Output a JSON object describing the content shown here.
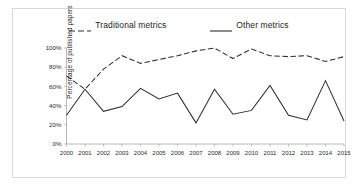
{
  "figure": {
    "background_color": "#ffffff",
    "frame_color": "#d8d8d8"
  },
  "legend": {
    "position": "top-center",
    "entries": [
      {
        "label": "Traditional metrics",
        "style": "dashed",
        "color": "#2e2e2e",
        "swatch_name": "legend-swatch-dashed"
      },
      {
        "label": "Other metrics",
        "style": "solid",
        "color": "#2e2e2e",
        "swatch_name": "legend-swatch-solid"
      }
    ]
  },
  "axes": {
    "ylabel": "Percentage of published papers",
    "xlabel": "",
    "yticks": [
      "0%",
      "20%",
      "40%",
      "60%",
      "80%",
      "100%"
    ],
    "ytick_values": [
      0,
      20,
      40,
      60,
      80,
      100
    ],
    "ylim": [
      0,
      100
    ],
    "grid": false,
    "axis_color": "#9a9a9a"
  },
  "chart_data": {
    "type": "line",
    "title": "",
    "subtitle": "",
    "xlabel": "",
    "ylabel": "Percentage of published papers",
    "ylim": [
      0,
      100
    ],
    "ytick_labels": [
      "0%",
      "20%",
      "40%",
      "60%",
      "80%",
      "100%"
    ],
    "grid": false,
    "legend_position": "top-center",
    "categories": [
      "2000",
      "2001",
      "2002",
      "2003",
      "2004",
      "2005",
      "2006",
      "2007",
      "2008",
      "2009",
      "2010",
      "2011",
      "2012",
      "2013",
      "2014",
      "2015"
    ],
    "series": [
      {
        "name": "Traditional metrics",
        "style": "dashed",
        "color": "#2e2e2e",
        "values": [
          71,
          57,
          78,
          92,
          84,
          88,
          92,
          97,
          100,
          89,
          99,
          92,
          91,
          92,
          86,
          91
        ]
      },
      {
        "name": "Other metrics",
        "style": "solid",
        "color": "#2e2e2e",
        "values": [
          30,
          57,
          34,
          39,
          58,
          47,
          53,
          22,
          57,
          31,
          35,
          61,
          30,
          25,
          66,
          24
        ]
      }
    ],
    "annotations": []
  }
}
